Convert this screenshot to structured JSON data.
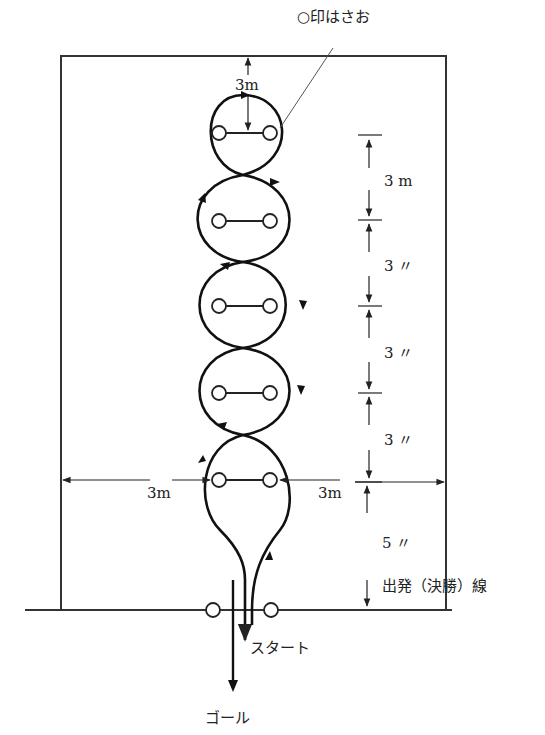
{
  "diagram": {
    "legend": {
      "text": "○印はさお"
    },
    "labels": {
      "top_gap": "3m",
      "spacing": [
        "3 m",
        "3 〃",
        "3 〃",
        "3 〃"
      ],
      "last_spacing": "5 〃",
      "left_side": "3m",
      "right_side": "3m",
      "start_line": "出発（決勝）線",
      "start": "スタート",
      "goal": "ゴール"
    },
    "colors": {
      "line": "#222222",
      "background": "#ffffff"
    },
    "pole_rows_y": [
      133,
      221,
      306,
      393,
      480
    ],
    "start_line_poles": [
      [
        213,
        610
      ],
      [
        271,
        610
      ]
    ]
  }
}
